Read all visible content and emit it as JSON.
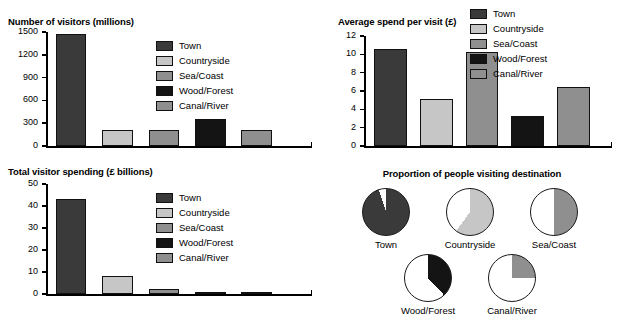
{
  "palette": {
    "town": "#3a3a3a",
    "countryside": "#c6c6c6",
    "sea_coast": "#8f8f8f",
    "wood_forest": "#141414",
    "canal_river": "#8f8f8f",
    "axis": "#000000",
    "background": "#ffffff"
  },
  "legend": {
    "items": [
      {
        "label": "Town",
        "color": "#3a3a3a"
      },
      {
        "label": "Countryside",
        "color": "#c6c6c6"
      },
      {
        "label": "Sea/Coast",
        "color": "#8f8f8f"
      },
      {
        "label": "Wood/Forest",
        "color": "#141414"
      },
      {
        "label": "Canal/River",
        "color": "#8f8f8f"
      }
    ]
  },
  "chart_data": [
    {
      "id": "visitors",
      "type": "bar",
      "title": "Number of visitors (millions)",
      "xlabel": "",
      "ylabel": "",
      "categories": [
        "Town",
        "Countryside",
        "Sea/Coast",
        "Wood/Forest",
        "Canal/River"
      ],
      "values": [
        1480,
        205,
        210,
        360,
        205
      ],
      "ylim": [
        0,
        1500
      ],
      "yticks": [
        0,
        300,
        600,
        900,
        1200,
        1500
      ],
      "ytick_labels": [
        "0",
        "300",
        "600",
        "900",
        "1200",
        "1500"
      ],
      "grid": false,
      "legend_position": "inside-top-right"
    },
    {
      "id": "avg_spend",
      "type": "bar",
      "title": "Average spend per visit (£)",
      "xlabel": "",
      "ylabel": "",
      "categories": [
        "Town",
        "Countryside",
        "Sea/Coast",
        "Wood/Forest",
        "Canal/River"
      ],
      "values": [
        10.6,
        5.1,
        10.3,
        3.3,
        6.4
      ],
      "ylim": [
        0,
        12
      ],
      "yticks": [
        0,
        2,
        4,
        6,
        8,
        10,
        12
      ],
      "ytick_labels": [
        "0",
        "2",
        "4",
        "6",
        "8",
        "10",
        "12"
      ],
      "grid": false,
      "legend_position": "top-right"
    },
    {
      "id": "total_spending",
      "type": "bar",
      "title": "Total visitor spending (£ billions)",
      "xlabel": "",
      "ylabel": "",
      "categories": [
        "Town",
        "Countryside",
        "Sea/Coast",
        "Wood/Forest",
        "Canal/River"
      ],
      "values": [
        43,
        8.2,
        2.1,
        0.7,
        1.0
      ],
      "ylim": [
        0,
        50
      ],
      "yticks": [
        0,
        10,
        20,
        30,
        40,
        50
      ],
      "ytick_labels": [
        "0",
        "10",
        "20",
        "30",
        "40",
        "50"
      ],
      "grid": false,
      "legend_position": "inside-top-right"
    },
    {
      "id": "proportion_visiting",
      "type": "pie",
      "title": "Proportion of people visiting destination",
      "slices": [
        {
          "label": "Town",
          "value": 95,
          "color": "#3a3a3a"
        },
        {
          "label": "Countryside",
          "value": 60,
          "color": "#c6c6c6"
        },
        {
          "label": "Sea/Coast",
          "value": 50,
          "color": "#8f8f8f"
        },
        {
          "label": "Wood/Forest",
          "value": 38,
          "color": "#141414"
        },
        {
          "label": "Canal/River",
          "value": 25,
          "color": "#8f8f8f"
        }
      ],
      "remainder_color": "#ffffff",
      "units": "percent"
    }
  ]
}
